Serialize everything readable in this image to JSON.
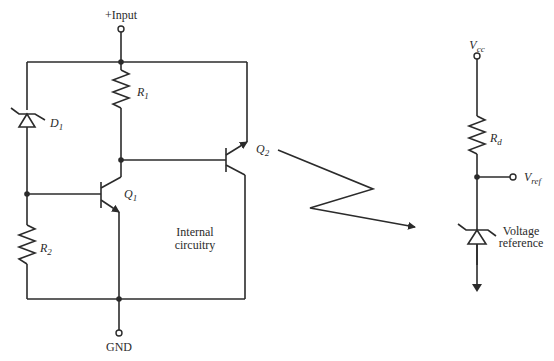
{
  "diagram": {
    "left_circuit": {
      "input_label": "+Input",
      "ground_label": "GND",
      "components": {
        "R1": {
          "base": "R",
          "sub": "1"
        },
        "R2": {
          "base": "R",
          "sub": "2"
        },
        "D1": {
          "base": "D",
          "sub": "1"
        },
        "Q1": {
          "base": "Q",
          "sub": "1"
        },
        "Q2": {
          "base": "Q",
          "sub": "2"
        }
      },
      "block_label_line1": "Internal",
      "block_label_line2": "circuitry"
    },
    "right_circuit": {
      "supply": {
        "base": "V",
        "sub": "cc"
      },
      "resistor": {
        "base": "R",
        "sub": "d"
      },
      "output": {
        "base": "V",
        "sub": "ref"
      },
      "zener_label_line1": "Voltage",
      "zener_label_line2": "reference"
    }
  }
}
